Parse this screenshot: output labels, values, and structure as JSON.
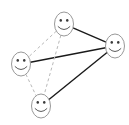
{
  "figure": {
    "background_color": "#ffffff",
    "width": 129,
    "height": 125
  },
  "style": {
    "solid_edge_color": "#1a1a1a",
    "solid_edge_width": 1.4,
    "dashed_edge_color": "#b9b9b9",
    "dashed_edge_width": 1.0,
    "dash_pattern": "3,2.6",
    "node_outline_color": "#8c8c8c",
    "node_outline_width": 0.9,
    "node_fill_color": "#ffffff",
    "eye_color": "#3a3a3a",
    "mouth_color": "#4a4a4a",
    "mouth_width": 0.9
  },
  "chart_data": {
    "type": "diagram",
    "subtype": "node-link-graph",
    "node_count": 4,
    "edge_count": 6,
    "nodes": [
      {
        "id": "top",
        "label": "top-face",
        "x": 64,
        "y": 24,
        "rx": 9.5,
        "ry": 12.0
      },
      {
        "id": "right",
        "label": "right-face",
        "x": 115,
        "y": 46,
        "rx": 9.5,
        "ry": 12.0
      },
      {
        "id": "left",
        "label": "left-face",
        "x": 21,
        "y": 64,
        "rx": 9.5,
        "ry": 12.0
      },
      {
        "id": "bottom",
        "label": "bottom-face",
        "x": 41,
        "y": 106,
        "rx": 9.5,
        "ry": 12.0
      }
    ],
    "edges": [
      {
        "id": "top-right",
        "from": "top",
        "to": "right",
        "style": "solid"
      },
      {
        "id": "left-right",
        "from": "left",
        "to": "right",
        "style": "solid"
      },
      {
        "id": "bottom-right",
        "from": "bottom",
        "to": "right",
        "style": "solid"
      },
      {
        "id": "top-left",
        "from": "top",
        "to": "left",
        "style": "dashed"
      },
      {
        "id": "top-bottom",
        "from": "top",
        "to": "bottom",
        "style": "dashed"
      },
      {
        "id": "left-bottom",
        "from": "left",
        "to": "bottom",
        "style": "dashed"
      }
    ],
    "legend": [],
    "annotations": []
  }
}
